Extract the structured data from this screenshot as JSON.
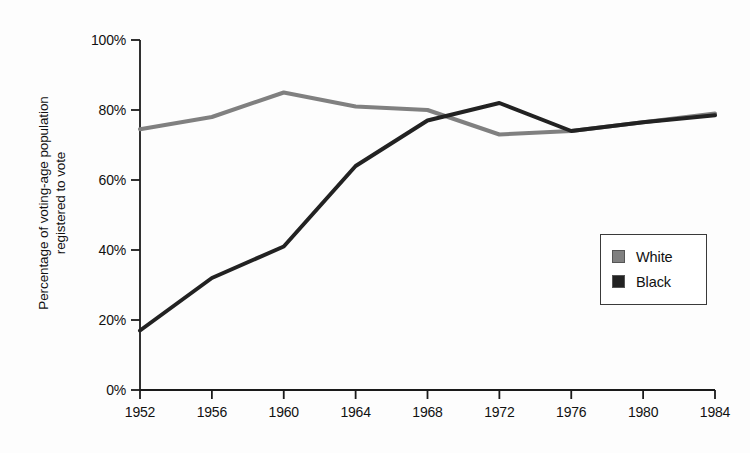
{
  "chart_data": {
    "type": "line",
    "title": "",
    "xlabel": "",
    "ylabel": "Percentage of voting-age population\nregistered to vote",
    "x": [
      1952,
      1956,
      1960,
      1964,
      1968,
      1972,
      1976,
      1980,
      1984
    ],
    "xtick_labels": [
      "1952",
      "1956",
      "1960",
      "1964",
      "1968",
      "1972",
      "1976",
      "1980",
      "1984"
    ],
    "ytick_labels": [
      "0%",
      "20%",
      "40%",
      "60%",
      "80%",
      "100%"
    ],
    "yticks": [
      0,
      20,
      40,
      60,
      80,
      100
    ],
    "ylim": [
      0,
      100
    ],
    "xlim": [
      1952,
      1984
    ],
    "grid": false,
    "legend_position": "center-right",
    "series": [
      {
        "name": "White",
        "color": "#808080",
        "values": [
          74.5,
          78,
          85,
          81,
          80,
          73,
          74,
          76.5,
          79
        ]
      },
      {
        "name": "Black",
        "color": "#222222",
        "values": [
          17,
          32,
          41,
          64,
          77,
          82,
          74,
          76.5,
          78.5
        ]
      }
    ]
  },
  "legend": {
    "items": [
      {
        "label": "White",
        "color": "#808080"
      },
      {
        "label": "Black",
        "color": "#222222"
      }
    ]
  },
  "axis": {
    "line_color": "#1a1a1a"
  }
}
